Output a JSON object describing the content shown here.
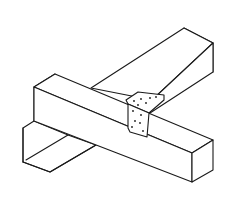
{
  "diagram": {
    "subject": "Two crossing rectangular timber beams joined with a perforated metal angle bracket",
    "style": "black line drawing on white, isometric view",
    "components": [
      {
        "name": "front-beam",
        "description": "horizontal beam running lower-left to lower-right in the foreground"
      },
      {
        "name": "back-beam",
        "description": "beam running from lower-left to upper-right, passing beneath the front beam"
      },
      {
        "name": "angle-bracket",
        "description": "L-shaped metal bracket with nail holes at the joint",
        "holes_top_leg": 6,
        "holes_side_leg": 6
      }
    ],
    "colors": {
      "line": "#1a1a1a",
      "background": "#ffffff"
    }
  }
}
